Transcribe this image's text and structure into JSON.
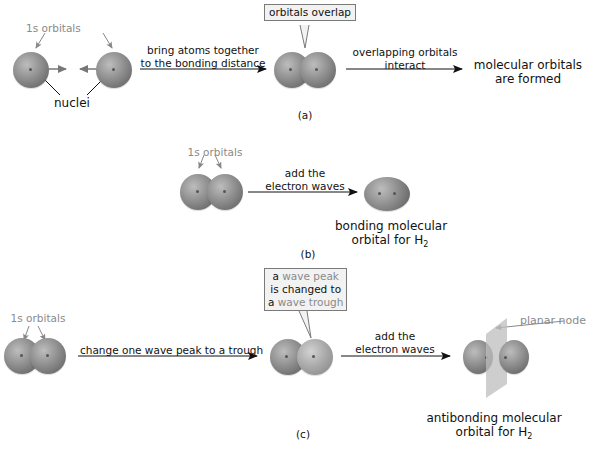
{
  "panel_a": {
    "label": "(a)",
    "orbitals_label": "1s orbitals",
    "nuclei_label": "nuclei",
    "arrow1_line1": "bring atoms together",
    "arrow1_line2": "to the bonding distance",
    "callout": "orbitals overlap",
    "arrow2_line1": "overlapping orbitals",
    "arrow2_line2": "interact",
    "result_line1": "molecular orbitals",
    "result_line2": "are formed"
  },
  "panel_b": {
    "label": "(b)",
    "orbitals_label": "1s orbitals",
    "arrow_line1": "add the",
    "arrow_line2": "electron waves",
    "result_line1": "bonding molecular",
    "result_line2": "orbital for H",
    "result_sub": "2"
  },
  "panel_c": {
    "label": "(c)",
    "orbitals_label": "1s orbitals",
    "arrow1_label": "change one wave peak to a trough",
    "callout_line1_a": "a ",
    "callout_line1_b": "wave peak",
    "callout_line2": "is changed to",
    "callout_line3_a": "a ",
    "callout_line3_b": "wave trough",
    "arrow2_line1": "add the",
    "arrow2_line2": "electron waves",
    "node_label": "planar node",
    "result_line1": "antibonding molecular",
    "result_line2": "orbital for H",
    "result_sub": "2"
  }
}
